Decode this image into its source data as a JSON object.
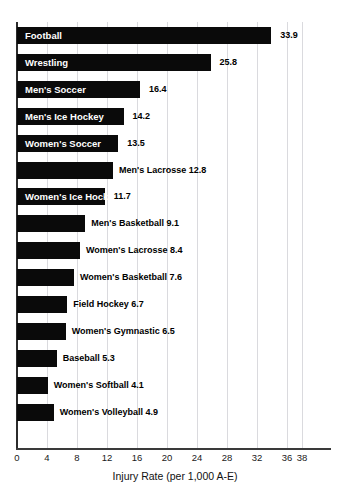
{
  "chart_data": {
    "type": "bar",
    "orientation": "horizontal",
    "title": "",
    "xlabel": "Injury Rate (per 1,000 A-E)",
    "ylabel": "",
    "xlim": [
      0,
      38
    ],
    "xticks": [
      0,
      4,
      8,
      12,
      16,
      20,
      24,
      28,
      32,
      36,
      38
    ],
    "grid": true,
    "legend": "none",
    "bar_color": "#0a0a0a",
    "categories": [
      "Football",
      "Wrestling",
      "Men's Soccer",
      "Men's Ice Hockey",
      "Women's Soccer",
      "Men's Lacrosse",
      "Women's Ice Hockey",
      "Men's Basketball",
      "Women's Lacrosse",
      "Women's Basketball",
      "Field Hockey",
      "Women's Gymnastic",
      "Baseball",
      "Women's Softball",
      "Women's Volleyball"
    ],
    "values": [
      33.9,
      25.8,
      16.4,
      14.2,
      13.5,
      12.8,
      11.7,
      9.1,
      8.4,
      7.6,
      6.7,
      6.5,
      5.3,
      4.1,
      4.9
    ],
    "bars": [
      {
        "category": "Football",
        "value": 33.9,
        "value_text": "33.9",
        "label_position": "inside"
      },
      {
        "category": "Wrestling",
        "value": 25.8,
        "value_text": "25.8",
        "label_position": "inside"
      },
      {
        "category": "Men's Soccer",
        "value": 16.4,
        "value_text": "16.4",
        "label_position": "inside"
      },
      {
        "category": "Men's Ice Hockey",
        "value": 14.2,
        "value_text": "14.2",
        "label_position": "inside"
      },
      {
        "category": "Women's Soccer",
        "value": 13.5,
        "value_text": "13.5",
        "label_position": "inside"
      },
      {
        "category": "Men's Lacrosse",
        "value": 12.8,
        "value_text": "12.8",
        "label_position": "outside"
      },
      {
        "category": "Women's Ice Hockey",
        "value": 11.7,
        "value_text": "11.7",
        "label_position": "inside"
      },
      {
        "category": "Men's Basketball",
        "value": 9.1,
        "value_text": "9.1",
        "label_position": "outside"
      },
      {
        "category": "Women's Lacrosse",
        "value": 8.4,
        "value_text": "8.4",
        "label_position": "outside"
      },
      {
        "category": "Women's Basketball",
        "value": 7.6,
        "value_text": "7.6",
        "label_position": "outside"
      },
      {
        "category": "Field Hockey",
        "value": 6.7,
        "value_text": "6.7",
        "label_position": "outside"
      },
      {
        "category": "Women's Gymnastic",
        "value": 6.5,
        "value_text": "6.5",
        "label_position": "outside"
      },
      {
        "category": "Baseball",
        "value": 5.3,
        "value_text": "5.3",
        "label_position": "outside"
      },
      {
        "category": "Women's Softball",
        "value": 4.1,
        "value_text": "4.1",
        "label_position": "outside"
      },
      {
        "category": "Women's Volleyball",
        "value": 4.9,
        "value_text": "4.9",
        "label_position": "outside"
      }
    ]
  }
}
